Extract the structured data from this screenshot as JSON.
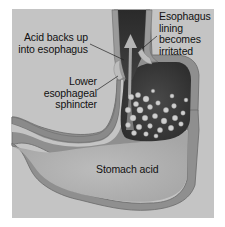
{
  "diagram": {
    "colors": {
      "page_background": "#ffffff",
      "panel_background": "#c4c4c4",
      "stomach_wall": "#8f8f8f",
      "stomach_wall_outline": "#6a6a6a",
      "stomach_interior": "#b3b3b3",
      "upper_stomach_dark": "#3a3a3a",
      "esophagus_lumen": "#333333",
      "acid_bubbles": "#d0d0d0",
      "arrow": "#b5b5b5",
      "label_text": "#111111",
      "leader_line": "#222222"
    },
    "labels": [
      {
        "id": "acid-backs-up",
        "text": "Acid backs up\ninto esophagus"
      },
      {
        "id": "esophagus-lining",
        "text": "Esophagus\nlining\nbecomes\nirritated"
      },
      {
        "id": "lower-esophageal-sphincter",
        "text": "Lower\nesophageal\nsphincter"
      },
      {
        "id": "stomach-acid",
        "text": "Stomach acid"
      }
    ]
  }
}
